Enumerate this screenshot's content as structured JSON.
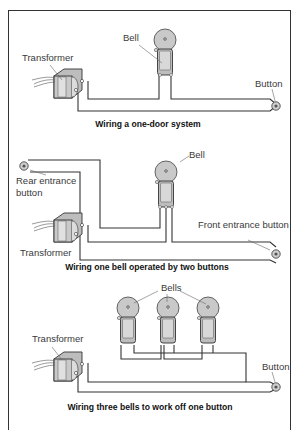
{
  "panels": [
    {
      "caption": "Wiring a one-door system",
      "labels": {
        "transformer": "Transformer",
        "bell": "Bell",
        "button": "Button"
      }
    },
    {
      "caption": "Wiring one bell operated by two buttons",
      "labels": {
        "rear_button": [
          "Rear entrance",
          "button"
        ],
        "bell": "Bell",
        "front_button": "Front entrance button",
        "transformer": "Transformer"
      }
    },
    {
      "caption": "Wiring three bells to work off one button",
      "labels": {
        "bells": "Bells",
        "transformer": "Transformer",
        "button": "Button"
      }
    }
  ],
  "colors": {
    "line": "#333333",
    "bell_fill": "#c8c8c8",
    "body_fill": "#d4d4d4",
    "background": "#ffffff"
  }
}
